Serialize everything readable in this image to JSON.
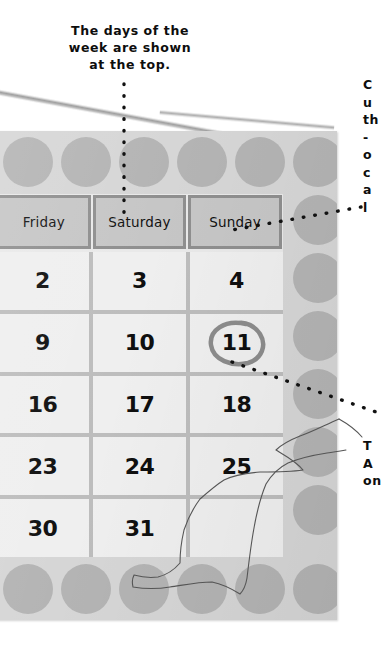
{
  "annotations": {
    "top": "The days of the\nweek are shown\nat the top.",
    "right_cropped": "C\nu\nth\n-\no\nc\na\nl",
    "right_lower_cropped": "T\nA\non"
  },
  "calendar": {
    "day_headers": [
      "Friday",
      "Saturday",
      "Sunday"
    ],
    "weeks": [
      [
        "2",
        "3",
        "4"
      ],
      [
        "9",
        "10",
        "11"
      ],
      [
        "16",
        "17",
        "18"
      ],
      [
        "23",
        "24",
        "25"
      ],
      [
        "30",
        "31",
        ""
      ]
    ],
    "circled_day": "11",
    "colors": {
      "frame": "#d6d6d6",
      "frame_dot": "#b4b4b4",
      "header_cell": "#c6c6c6",
      "header_border": "#8f8f8f",
      "date_cell": "#efefef",
      "grid_line": "#bdbdbd",
      "circle_mark": "#8c8c8c",
      "text": "#0f0f0f"
    }
  },
  "leaders": {
    "top_to_header": "dotted-vertical-line",
    "right_to_sunday": "dotted-diagonal-line",
    "right_to_circled_day": "dotted-diagonal-line"
  }
}
